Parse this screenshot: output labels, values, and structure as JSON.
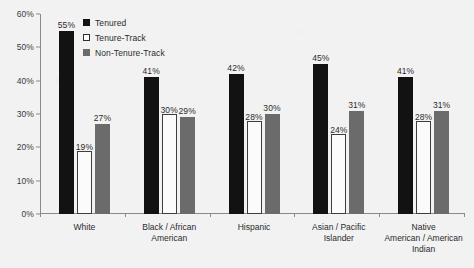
{
  "chart_data": {
    "type": "bar",
    "title": "",
    "xlabel": "",
    "ylabel": "",
    "ylim": [
      0,
      60
    ],
    "ytick_labels": [
      "0%",
      "10%",
      "20%",
      "30%",
      "40%",
      "50%",
      "60%"
    ],
    "ytick_values": [
      0,
      10,
      20,
      30,
      40,
      50,
      60
    ],
    "grid": false,
    "legend_position": "top-left-inside",
    "categories": [
      "White",
      "Black / African\nAmerican",
      "Hispanic",
      "Asian / Pacific\nIslander",
      "Native\nAmerican / American\nIndian"
    ],
    "series": [
      {
        "name": "Tenured",
        "color": "#121212",
        "values": [
          55,
          41,
          42,
          45,
          41
        ],
        "labels": [
          "55%",
          "41%",
          "42%",
          "45%",
          "41%"
        ]
      },
      {
        "name": "Tenure-Track",
        "color": "#fbfbfb",
        "values": [
          19,
          30,
          28,
          24,
          28
        ],
        "labels": [
          "19%",
          "30%",
          "28%",
          "24%",
          "28%"
        ]
      },
      {
        "name": "Non-Tenure-Track",
        "color": "#6b6b6b",
        "values": [
          27,
          29,
          30,
          31,
          31
        ],
        "labels": [
          "27%",
          "29%",
          "30%",
          "31%",
          "31%"
        ]
      }
    ]
  },
  "legend": {
    "items": [
      {
        "label": "Tenured",
        "swatch": "filled-black-square-icon"
      },
      {
        "label": "Tenure-Track",
        "swatch": "outlined-white-square-icon"
      },
      {
        "label": "Non-Tenure-Track",
        "swatch": "filled-gray-square-icon"
      }
    ]
  }
}
